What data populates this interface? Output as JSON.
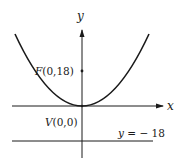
{
  "diagram": {
    "type": "parabola-focus-directrix",
    "axes": {
      "x_label": "x",
      "y_label": "y"
    },
    "parabola": {
      "equation_hint": "x^2 = 72y",
      "opens": "up"
    },
    "focus": {
      "letter": "F",
      "coords": "(0,18)"
    },
    "vertex": {
      "letter": "V",
      "coords": "(0,0)"
    },
    "directrix": {
      "var": "y",
      "eq": " = − 18"
    },
    "colors": {
      "stroke": "#1a1a1a",
      "background": "#ffffff"
    }
  }
}
